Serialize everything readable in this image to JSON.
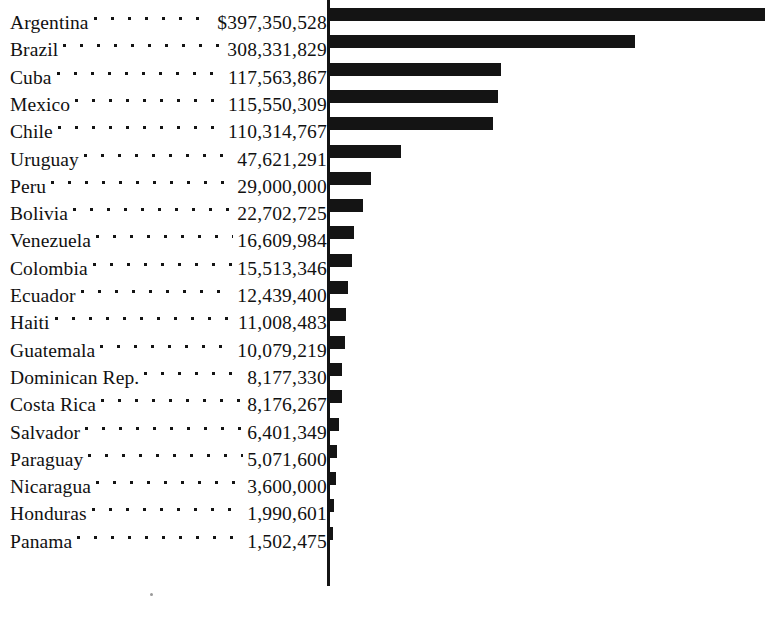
{
  "chart_data": {
    "type": "bar",
    "title": "",
    "subtitle": "",
    "xlabel": "",
    "ylabel": "",
    "orientation": "horizontal",
    "grid": false,
    "legend": null,
    "currency_symbol": "$",
    "value_unit": "dollars",
    "axis_origin_px": 328,
    "max_bar_px": 765,
    "categories": [
      "Argentina",
      "Brazil",
      "Cuba",
      "Mexico",
      "Chile",
      "Uruguay",
      "Peru",
      "Bolivia",
      "Venezuela",
      "Colombia",
      "Ecuador",
      "Haiti",
      "Guatemala",
      "Dominican Rep.",
      "Costa Rica",
      "Salvador",
      "Paraguay",
      "Nicaragua",
      "Honduras",
      "Panama"
    ],
    "values": [
      397350528,
      308331829,
      117563867,
      115550309,
      110314767,
      47621291,
      29000000,
      22702725,
      16609984,
      15513346,
      12439400,
      11008483,
      10079219,
      8177330,
      8176267,
      6401349,
      5071600,
      3600000,
      1990601,
      1502475
    ],
    "value_labels": [
      "$397,350,528",
      "308,331,829",
      "117,563,867",
      "115,550,309",
      "110,314,767",
      "47,621,291",
      "29,000,000",
      "22,702,725",
      "16,609,984",
      "15,513,346",
      "12,439,400",
      "11,008,483",
      "10,079,219",
      "8,177,330",
      "8,176,267",
      "6,401,349",
      "5,071,600",
      "3,600,000",
      "1,990,601",
      "1,502,475"
    ],
    "bar_lengths_px": [
      436,
      306,
      172,
      169,
      164,
      72,
      42,
      34,
      25,
      23,
      19,
      17,
      16,
      13,
      13,
      10,
      8,
      7,
      5,
      4
    ],
    "bar_color": "#141414",
    "background_color": "#ffffff"
  },
  "rows": [
    {
      "country": "Argentina",
      "value_label": "$397,350,528",
      "bar_px": 436
    },
    {
      "country": "Brazil",
      "value_label": "308,331,829",
      "bar_px": 306
    },
    {
      "country": "Cuba",
      "value_label": "117,563,867",
      "bar_px": 172
    },
    {
      "country": "Mexico",
      "value_label": "115,550,309",
      "bar_px": 169
    },
    {
      "country": "Chile",
      "value_label": "110,314,767",
      "bar_px": 164
    },
    {
      "country": "Uruguay",
      "value_label": "47,621,291",
      "bar_px": 72
    },
    {
      "country": "Peru",
      "value_label": "29,000,000",
      "bar_px": 42
    },
    {
      "country": "Bolivia",
      "value_label": "22,702,725",
      "bar_px": 34
    },
    {
      "country": "Venezuela",
      "value_label": "16,609,984",
      "bar_px": 25
    },
    {
      "country": "Colombia",
      "value_label": "15,513,346",
      "bar_px": 23
    },
    {
      "country": "Ecuador",
      "value_label": "12,439,400",
      "bar_px": 19
    },
    {
      "country": "Haiti",
      "value_label": "11,008,483",
      "bar_px": 17
    },
    {
      "country": "Guatemala",
      "value_label": "10,079,219",
      "bar_px": 16
    },
    {
      "country": "Dominican Rep.",
      "value_label": "8,177,330",
      "bar_px": 13
    },
    {
      "country": "Costa Rica",
      "value_label": "8,176,267",
      "bar_px": 13
    },
    {
      "country": "Salvador",
      "value_label": "6,401,349",
      "bar_px": 10
    },
    {
      "country": "Paraguay",
      "value_label": "5,071,600",
      "bar_px": 8
    },
    {
      "country": "Nicaragua",
      "value_label": "3,600,000",
      "bar_px": 7
    },
    {
      "country": "Honduras",
      "value_label": "1,990,601",
      "bar_px": 5
    },
    {
      "country": "Panama",
      "value_label": "1,502,475",
      "bar_px": 4
    }
  ],
  "layout": {
    "row_height_px": 27.3,
    "first_row_top_px": 2
  }
}
